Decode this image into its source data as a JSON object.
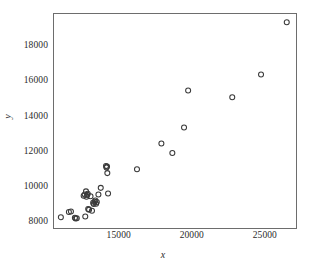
{
  "chart_data": {
    "type": "scatter",
    "title": "",
    "xlabel": "x",
    "ylabel": "y",
    "xlim": [
      10500,
      27200
    ],
    "ylim": [
      7600,
      19900
    ],
    "xticks": [
      15000,
      20000,
      25000
    ],
    "xtick_labels": [
      "15000",
      "20000",
      "25000"
    ],
    "yticks": [
      8000,
      10000,
      12000,
      14000,
      16000,
      18000
    ],
    "ytick_labels": [
      "8000",
      "10000",
      "12000",
      "14000",
      "16000",
      "18000"
    ],
    "grid": false,
    "legend": null,
    "marker": "open-circle",
    "marker_color": "#3a3a3a",
    "points": [
      {
        "x": 10970,
        "y": 8330
      },
      {
        "x": 11520,
        "y": 8630
      },
      {
        "x": 11660,
        "y": 8650
      },
      {
        "x": 11930,
        "y": 8300
      },
      {
        "x": 11980,
        "y": 8250
      },
      {
        "x": 12060,
        "y": 8270
      },
      {
        "x": 12640,
        "y": 8370
      },
      {
        "x": 12530,
        "y": 9550
      },
      {
        "x": 12600,
        "y": 9620
      },
      {
        "x": 12690,
        "y": 9800
      },
      {
        "x": 12720,
        "y": 9490
      },
      {
        "x": 12770,
        "y": 9600
      },
      {
        "x": 12810,
        "y": 9660
      },
      {
        "x": 12840,
        "y": 8800
      },
      {
        "x": 12900,
        "y": 8760
      },
      {
        "x": 13000,
        "y": 9520
      },
      {
        "x": 13100,
        "y": 8700
      },
      {
        "x": 13180,
        "y": 9150
      },
      {
        "x": 13220,
        "y": 9080
      },
      {
        "x": 13280,
        "y": 9210
      },
      {
        "x": 13330,
        "y": 9280
      },
      {
        "x": 13380,
        "y": 9100
      },
      {
        "x": 13430,
        "y": 9190
      },
      {
        "x": 13540,
        "y": 9620
      },
      {
        "x": 13700,
        "y": 10000
      },
      {
        "x": 14060,
        "y": 11240
      },
      {
        "x": 14090,
        "y": 11160
      },
      {
        "x": 14130,
        "y": 11210
      },
      {
        "x": 14150,
        "y": 10840
      },
      {
        "x": 14200,
        "y": 9680
      },
      {
        "x": 16180,
        "y": 11060
      },
      {
        "x": 17850,
        "y": 12530
      },
      {
        "x": 18600,
        "y": 11990
      },
      {
        "x": 19400,
        "y": 13440
      },
      {
        "x": 19680,
        "y": 15540
      },
      {
        "x": 22700,
        "y": 15160
      },
      {
        "x": 24670,
        "y": 16460
      },
      {
        "x": 26430,
        "y": 19430
      }
    ]
  }
}
